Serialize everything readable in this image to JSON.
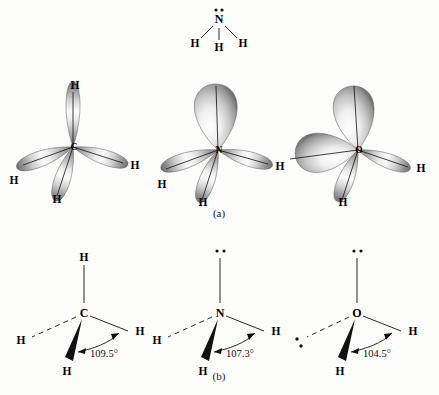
{
  "figure": {
    "background_color": "#fdfdfc",
    "ink_color": "#111111",
    "lobe_light": "#ffffff",
    "lobe_mid": "#b9b9b9",
    "lobe_dark": "#6b6b6b"
  },
  "lewis_structure": {
    "name": "ammonia-lewis-structure",
    "center_atom": "N",
    "lone_pair_dots": "··",
    "hydrogens": [
      "H",
      "H",
      "H"
    ]
  },
  "panels": {
    "a_label": "(a)",
    "b_label": "(b)"
  },
  "orbital_row": {
    "caption": "(a)",
    "molecules": [
      {
        "id": "carbon-orbital",
        "center_atom": "C",
        "lone_pairs": 0,
        "bonds": 4,
        "hydrogen_labels": [
          "H",
          "H",
          "H",
          "H"
        ]
      },
      {
        "id": "nitrogen-orbital",
        "center_atom": "N",
        "lone_pairs": 1,
        "bonds": 3,
        "hydrogen_labels": [
          "H",
          "H",
          "H"
        ]
      },
      {
        "id": "oxygen-orbital",
        "center_atom": "O",
        "lone_pairs": 2,
        "bonds": 2,
        "hydrogen_labels": [
          "H",
          "H"
        ]
      }
    ]
  },
  "geometry_row": {
    "caption": "(b)",
    "molecules": [
      {
        "id": "carbon-geometry",
        "center_atom": "C",
        "bond_angle": "109.5°",
        "hydrogen_labels": [
          "H",
          "H",
          "H",
          "H"
        ],
        "lone_pair_dots": [],
        "bond_styles": [
          "plain",
          "dashed",
          "wedge",
          "plain"
        ]
      },
      {
        "id": "nitrogen-geometry",
        "center_atom": "N",
        "bond_angle": "107.3°",
        "hydrogen_labels": [
          "H",
          "H",
          "H"
        ],
        "lone_pair_dots": [
          "··"
        ],
        "bond_styles": [
          "lone-pair",
          "dashed",
          "wedge",
          "plain"
        ]
      },
      {
        "id": "oxygen-geometry",
        "center_atom": "O",
        "bond_angle": "104.5°",
        "hydrogen_labels": [
          "H",
          "H"
        ],
        "lone_pair_dots": [
          "··",
          "··"
        ],
        "bond_styles": [
          "lone-pair",
          "lone-pair-dashed",
          "wedge",
          "plain"
        ]
      }
    ]
  }
}
